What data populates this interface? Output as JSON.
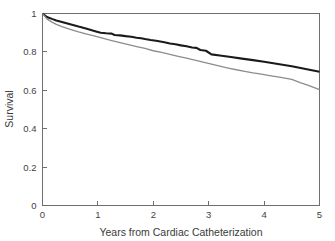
{
  "chart_data": {
    "type": "line",
    "title": "",
    "subtitle": "",
    "xlabel": "Years from Cardiac Catheterization",
    "ylabel": "Survival",
    "xlim": [
      0,
      5
    ],
    "ylim": [
      0,
      1
    ],
    "grid": false,
    "legend": "none",
    "xticks": [
      0,
      1,
      2,
      3,
      4,
      5
    ],
    "xtick_labels": [
      "0",
      "1",
      "2",
      "3",
      "4",
      "5"
    ],
    "yticks": [
      0,
      0.2,
      0.4,
      0.6,
      0.8,
      1
    ],
    "ytick_labels": [
      "0",
      "0.2",
      "0.4",
      "0.6",
      "0.8",
      "1"
    ],
    "frame": "full-box",
    "tick_direction": "in",
    "series": [
      {
        "name": "upper-survival-curve",
        "style": "solid",
        "color": "#1a1a1a",
        "linewidth": 2.1,
        "x": [
          0,
          0.08,
          0.17,
          0.25,
          0.35,
          0.5,
          0.65,
          0.8,
          0.95,
          1.05,
          1.15,
          1.25,
          1.3,
          1.4,
          1.5,
          1.6,
          1.7,
          1.78,
          1.85,
          1.95,
          2.05,
          2.15,
          2.2,
          2.3,
          2.4,
          2.5,
          2.6,
          2.7,
          2.78,
          2.85,
          2.95,
          3.05,
          3.2,
          3.4,
          3.6,
          3.8,
          4.0,
          4.25,
          4.5,
          4.75,
          5.0
        ],
        "y": [
          1.0,
          0.982,
          0.972,
          0.964,
          0.956,
          0.944,
          0.932,
          0.921,
          0.908,
          0.9,
          0.897,
          0.895,
          0.888,
          0.886,
          0.882,
          0.879,
          0.874,
          0.871,
          0.867,
          0.862,
          0.858,
          0.853,
          0.85,
          0.844,
          0.84,
          0.834,
          0.829,
          0.823,
          0.821,
          0.81,
          0.806,
          0.787,
          0.781,
          0.773,
          0.765,
          0.757,
          0.749,
          0.737,
          0.725,
          0.711,
          0.697
        ]
      },
      {
        "name": "lower-survival-curve",
        "style": "solid",
        "color": "#8c8c8c",
        "linewidth": 1.3,
        "x": [
          0,
          0.08,
          0.17,
          0.25,
          0.35,
          0.5,
          0.65,
          0.8,
          0.95,
          1.1,
          1.25,
          1.4,
          1.55,
          1.7,
          1.85,
          2.0,
          2.15,
          2.3,
          2.45,
          2.6,
          2.75,
          2.9,
          3.05,
          3.2,
          3.35,
          3.5,
          3.65,
          3.8,
          3.95,
          4.1,
          4.3,
          4.5,
          4.65,
          4.8,
          5.0
        ],
        "y": [
          1.0,
          0.972,
          0.955,
          0.943,
          0.932,
          0.917,
          0.904,
          0.893,
          0.882,
          0.87,
          0.859,
          0.848,
          0.838,
          0.828,
          0.818,
          0.806,
          0.797,
          0.787,
          0.777,
          0.767,
          0.757,
          0.747,
          0.736,
          0.726,
          0.716,
          0.707,
          0.699,
          0.691,
          0.684,
          0.677,
          0.667,
          0.657,
          0.64,
          0.626,
          0.604
        ]
      }
    ]
  }
}
